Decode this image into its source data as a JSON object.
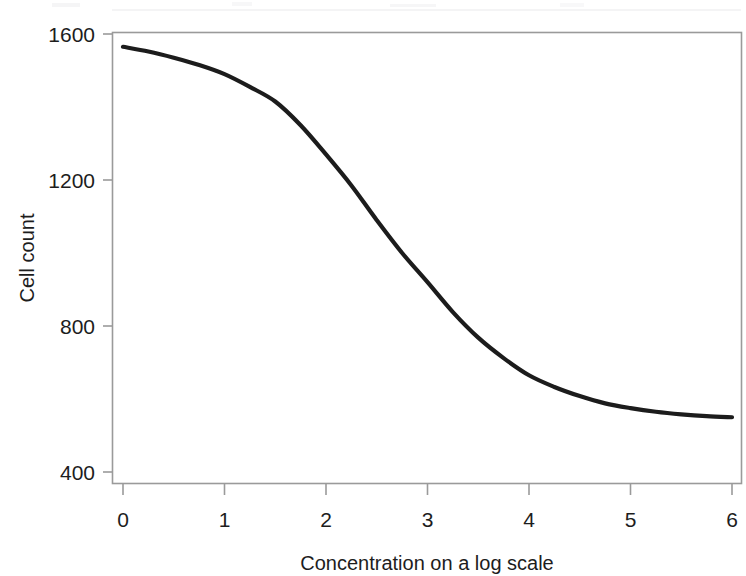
{
  "figure": {
    "background_color": "#ffffff",
    "frame_color": "#9a9a9a",
    "curve_color": "#1c1c1c",
    "text_color": "#1d1d1d"
  },
  "chart_data": {
    "type": "line",
    "title": "",
    "subtitle": "",
    "xlabel": "Concentration on a log scale",
    "ylabel": "Cell count",
    "xlim": [
      0,
      6
    ],
    "ylim": [
      400,
      1600
    ],
    "xticks": [
      0,
      1,
      2,
      3,
      4,
      5,
      6
    ],
    "xtick_labels": [
      "0",
      "1",
      "2",
      "3",
      "4",
      "5",
      "6"
    ],
    "yticks": [
      400,
      800,
      1200,
      1600
    ],
    "ytick_labels": [
      "400",
      "800",
      "1200",
      "1600"
    ],
    "grid": false,
    "legend": null,
    "annotations": [],
    "series": [
      {
        "name": "Dose response",
        "style": "solid",
        "color": "#1c1c1c",
        "linewidth": 4.2,
        "x": [
          0.0,
          0.25,
          0.5,
          0.75,
          1.0,
          1.25,
          1.5,
          1.75,
          2.0,
          2.25,
          2.5,
          2.75,
          3.0,
          3.25,
          3.5,
          3.75,
          4.0,
          4.25,
          4.5,
          4.75,
          5.0,
          5.25,
          5.5,
          5.75,
          6.0
        ],
        "y": [
          1565,
          1552,
          1535,
          1515,
          1490,
          1455,
          1415,
          1350,
          1270,
          1185,
          1090,
          1000,
          920,
          838,
          768,
          712,
          665,
          633,
          608,
          588,
          575,
          565,
          558,
          553,
          550
        ]
      }
    ]
  }
}
